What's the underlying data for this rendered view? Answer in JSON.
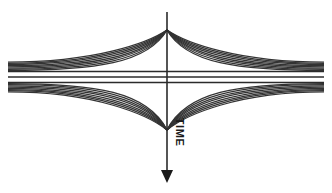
{
  "figure": {
    "background_color": "#ffffff",
    "width": 332,
    "height": 193
  },
  "axis": {
    "label": "TIME",
    "label_rotation_degrees": 90,
    "label_x": 176,
    "label_y": 132,
    "direction": "downward",
    "line_color": "#2b2b2b",
    "line_x": 167,
    "line_top_y": 12,
    "line_bottom_y": 178,
    "arrow_tip_y": 183,
    "arrow_half_width": 6,
    "arrow_height": 13
  },
  "style": {
    "curve_color": "#333333",
    "curve_width": 1.25,
    "band_color": "#2b2b2b",
    "band_width": 1.35
  },
  "geometry": {
    "apex_x": 167,
    "upper_apex_y": 30,
    "lower_apex_y": 130,
    "left_edge_x": 8,
    "right_edge_x": 324,
    "band_top_y": 71.5,
    "band_bottom_y": 82.5
  },
  "chart_data": {
    "type": "line",
    "xlabel": "",
    "ylabel": "TIME",
    "grid": false,
    "legend": "none",
    "xlim": [
      0,
      332
    ],
    "ylim": [
      193,
      0
    ],
    "apex_upper": [
      167,
      30
    ],
    "apex_lower": [
      167,
      130
    ],
    "band": {
      "count": 3,
      "y_values": [
        71.5,
        77,
        82.5
      ],
      "x_start": 8,
      "x_end": 324
    },
    "upper_fan": {
      "count": 8,
      "converge_at": [
        167,
        30
      ],
      "left_edge_y": [
        70.5,
        69.3,
        68.1,
        66.9,
        65.7,
        64.5,
        63.3,
        62.1
      ],
      "right_edge_y": [
        70.5,
        69.3,
        68.1,
        66.9,
        65.7,
        64.5,
        63.3,
        62.1
      ]
    },
    "lower_fan": {
      "count": 8,
      "converge_at": [
        167,
        130
      ],
      "left_edge_y": [
        83.5,
        84.7,
        85.9,
        87.1,
        88.3,
        89.5,
        90.7,
        91.9
      ],
      "right_edge_y": [
        83.5,
        84.7,
        85.9,
        87.1,
        88.3,
        89.5,
        90.7,
        91.9
      ]
    },
    "series": [
      {
        "name": "upper worldline bundle",
        "count": 8
      },
      {
        "name": "central straight band",
        "count": 3
      },
      {
        "name": "lower worldline bundle",
        "count": 8
      }
    ]
  }
}
